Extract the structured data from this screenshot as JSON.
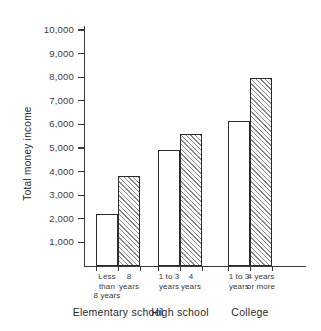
{
  "chart_data": {
    "type": "bar",
    "title": "",
    "subtitle": "",
    "xlabel": "",
    "ylabel": "Total money income",
    "ylim": [
      0,
      10500
    ],
    "ytick_interval": 1000,
    "grid": false,
    "legend": false,
    "categories": [
      "Less than 8 years",
      "8 years",
      "1 to 3 years",
      "4 years",
      "1 to 3 years",
      "4 years or more"
    ],
    "values": [
      2200,
      3830,
      4900,
      5600,
      6150,
      7950
    ],
    "bar_fills": [
      "plain",
      "hatched",
      "plain",
      "hatched",
      "plain",
      "hatched"
    ],
    "groups": [
      {
        "label": "Elementary school",
        "bars": [
          0,
          1
        ]
      },
      {
        "label": "High school",
        "bars": [
          2,
          3
        ]
      },
      {
        "label": "College",
        "bars": [
          4,
          5
        ]
      }
    ],
    "ytick_labels": [
      "1,000",
      "2,000",
      "3,000",
      "4,000",
      "5,000",
      "6,000",
      "7,000",
      "8,000",
      "9,000",
      "10,000"
    ],
    "ytick_values": [
      1000,
      2000,
      3000,
      4000,
      5000,
      6000,
      7000,
      8000,
      9000,
      10000
    ],
    "bar_labels": [
      [
        "Less",
        "than",
        "8 years"
      ],
      [
        "8",
        "years"
      ],
      [
        "1 to 3",
        "years"
      ],
      [
        "4",
        "years"
      ],
      [
        "1 to 3",
        "years"
      ],
      [
        "4 years",
        "or more"
      ]
    ],
    "colors": {
      "axis": "#3a3a3a",
      "bar_outline": "#2b2b2b",
      "bar_fill_plain": "#ffffff",
      "bar_hatch": "#8a8a8a",
      "text": "#2b2b2b",
      "background": "#ffffff"
    }
  }
}
